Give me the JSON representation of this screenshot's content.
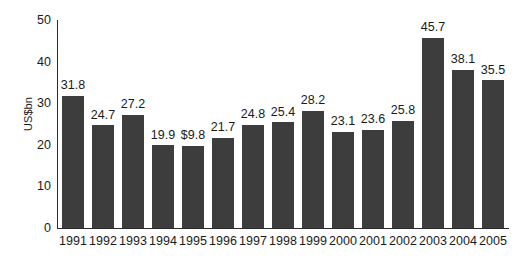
{
  "chart_data": {
    "type": "bar",
    "title": "",
    "subtitle": "",
    "xlabel": "",
    "ylabel": "US$bn",
    "ylim": [
      0,
      50
    ],
    "yticks": [
      0,
      10,
      20,
      30,
      40,
      50
    ],
    "ytick_labels": [
      "0",
      "10",
      "20",
      "30",
      "40",
      "50"
    ],
    "grid": false,
    "legend": false,
    "legend_position": "none",
    "orientation": "vertical",
    "bar_color": "#3d3d3d",
    "axis_color": "#2b2b2b",
    "background_color": "#ffffff",
    "text_color": "#1a1a1a",
    "categories": [
      "1991",
      "1992",
      "1993",
      "1994",
      "1995",
      "1996",
      "1997",
      "1998",
      "1999",
      "2000",
      "2001",
      "2002",
      "2003",
      "2004",
      "2005"
    ],
    "values": [
      31.8,
      24.7,
      27.2,
      19.9,
      19.8,
      21.7,
      24.8,
      25.4,
      28.2,
      23.1,
      23.6,
      25.8,
      45.7,
      38.1,
      35.5
    ],
    "data_labels": [
      "31.8",
      "24.7",
      "27.2",
      "19.9",
      "$9.8",
      "21.7",
      "24.8",
      "25.4",
      "28.2",
      "23.1",
      "23.6",
      "25.8",
      "45.7",
      "38.1",
      "35.5"
    ],
    "series": [
      {
        "name": "US$bn",
        "values": [
          31.8,
          24.7,
          27.2,
          19.9,
          19.8,
          21.7,
          24.8,
          25.4,
          28.2,
          23.1,
          23.6,
          25.8,
          45.7,
          38.1,
          35.5
        ]
      }
    ]
  }
}
